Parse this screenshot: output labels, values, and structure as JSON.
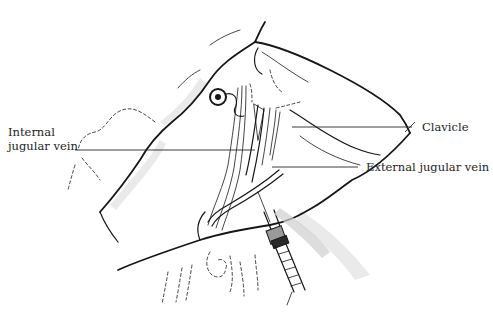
{
  "figure": {
    "labels": {
      "internal_jugular_line1": "Internal",
      "internal_jugular_line2": "jugular vein",
      "clavicle": "Clavicle",
      "external_jugular": "External jugular vein"
    },
    "colors": {
      "ink": "#161616",
      "shading": "#d9d9d9",
      "background": "#ffffff"
    }
  }
}
